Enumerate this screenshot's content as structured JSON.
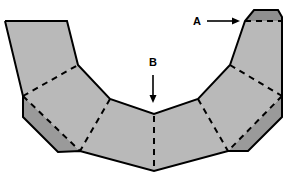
{
  "figure": {
    "type": "unfolded-net-diagram",
    "colors": {
      "face_light": "#b9b9b9",
      "face_dark": "#9a9a9a",
      "outline": "#000000",
      "fold_line": "#000000",
      "background": "#ffffff"
    },
    "labels": [
      {
        "id": "A",
        "text": "A",
        "arrow_direction": "right",
        "points_to": "top fold line of right end flap"
      },
      {
        "id": "B",
        "text": "B",
        "arrow_direction": "down",
        "points_to": "central vertical fold line"
      }
    ],
    "faces": [
      {
        "name": "left-top-panel",
        "shade": "light"
      },
      {
        "name": "left-middle-panel",
        "shade": "light"
      },
      {
        "name": "left-side-face",
        "shade": "dark"
      },
      {
        "name": "center-left-panel",
        "shade": "light"
      },
      {
        "name": "center-right-panel",
        "shade": "light"
      },
      {
        "name": "right-middle-panel",
        "shade": "light"
      },
      {
        "name": "right-side-face",
        "shade": "dark"
      },
      {
        "name": "right-top-panel",
        "shade": "light"
      },
      {
        "name": "right-top-cap",
        "shade": "dark"
      }
    ]
  }
}
